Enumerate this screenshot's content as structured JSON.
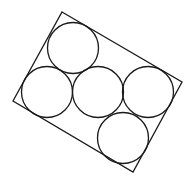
{
  "diagram": {
    "stroke_color": "#1a1a1a",
    "background": "#ffffff",
    "rectangle": {
      "points": [
        [
          62,
          12
        ],
        [
          182,
          82
        ],
        [
          133,
          172
        ],
        [
          13,
          101
        ]
      ]
    },
    "circles": [
      {
        "id": "top",
        "cx": 73,
        "cy": 48,
        "r": 25.5
      },
      {
        "id": "left",
        "cx": 47,
        "cy": 92,
        "r": 25.5
      },
      {
        "id": "middle",
        "cx": 98,
        "cy": 92,
        "r": 25.5
      },
      {
        "id": "right",
        "cx": 148,
        "cy": 92,
        "r": 25.5
      },
      {
        "id": "bottom",
        "cx": 123,
        "cy": 138,
        "r": 25.5
      }
    ]
  }
}
